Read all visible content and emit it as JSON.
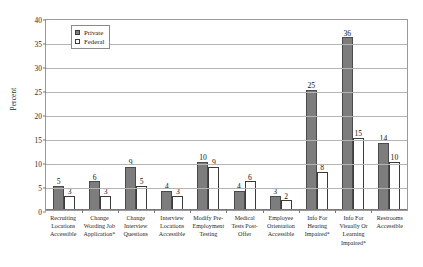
{
  "chart_data": {
    "type": "bar",
    "title": "",
    "xlabel": "",
    "ylabel": "Percent",
    "ylim": [
      0,
      40
    ],
    "ytick_step": 5,
    "yticks": [
      0,
      5,
      10,
      15,
      20,
      25,
      30,
      35,
      40
    ],
    "grid": true,
    "legend_position": "top-left-inside",
    "categories": [
      "Recruiting Locations Accessible",
      "Change Wording Job Application*",
      "Change Interview Questions",
      "Interview Locations Accessible",
      "Modify Pre-Employment Testing",
      "Medical Tests Post-Offer",
      "Employee Orientation Accessible",
      "Info For Hearing Impaired*",
      "Info For Visually Or Learning Impaired*",
      "Restrooms Accessible"
    ],
    "category_lines": [
      [
        "Recruiting",
        "Locations",
        "Accessible"
      ],
      [
        "Change",
        "Wording Job",
        "Application*"
      ],
      [
        "Change",
        "Interview",
        "Questions"
      ],
      [
        "Interview",
        "Locations",
        "Accessible"
      ],
      [
        "Modify Pre-",
        "Employment",
        "Testing"
      ],
      [
        "Medical",
        "Tests Post-",
        "Offer"
      ],
      [
        "Employee",
        "Orientation",
        "Accessible"
      ],
      [
        "Info For",
        "Hearing",
        "Impaired*"
      ],
      [
        "Info For",
        "Visually Or",
        "Learning",
        "Impaired*"
      ],
      [
        "Restrooms",
        "Accessible"
      ]
    ],
    "series": [
      {
        "name": "Private",
        "color": "#7d7d7d",
        "values": [
          5,
          6,
          9,
          4,
          10,
          4,
          3,
          25,
          36,
          14
        ]
      },
      {
        "name": "Federal",
        "color": "#ffffff",
        "values": [
          3,
          3,
          5,
          3,
          9,
          6,
          2,
          8,
          15,
          10
        ]
      }
    ]
  },
  "legend": {
    "items": [
      {
        "label": "Private"
      },
      {
        "label": "Federal"
      }
    ]
  },
  "footnote": {
    "text": ""
  }
}
